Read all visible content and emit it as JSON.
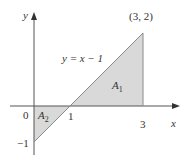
{
  "diagram": {
    "type": "area-between-line-and-axis",
    "axes": {
      "x_label": "x",
      "y_label": "y",
      "origin_label": "0",
      "x_ticks": [
        "1",
        "3"
      ],
      "y_ticks": [
        "−1"
      ]
    },
    "line": {
      "equation_label": "y = x − 1",
      "endpoint_label": "(3, 2)",
      "from": [
        0,
        -1
      ],
      "to": [
        3,
        2
      ]
    },
    "regions": [
      {
        "name": "A1",
        "label": "A",
        "subscript": "1",
        "vertices": [
          [
            1,
            0
          ],
          [
            3,
            0
          ],
          [
            3,
            2
          ]
        ]
      },
      {
        "name": "A2",
        "label": "A",
        "subscript": "2",
        "vertices": [
          [
            0,
            0
          ],
          [
            1,
            0
          ],
          [
            0,
            -1
          ]
        ]
      }
    ],
    "colors": {
      "shade": "#d9d9d9",
      "line": "#8a8a8a",
      "axis": "#555555",
      "text": "#333333"
    }
  }
}
